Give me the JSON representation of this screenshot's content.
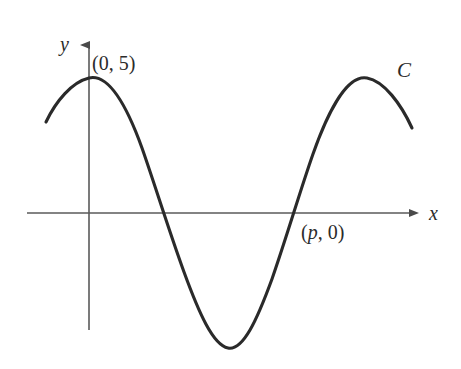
{
  "figure": {
    "background_color": "#ffffff",
    "axis_color": "#5a5a5a",
    "curve_color": "#2a2a2a",
    "text_color": "#2b2b2b"
  },
  "axes": {
    "x_label": "x",
    "y_label": "y",
    "x_axis_start_px": 27,
    "x_axis_end_px": 418,
    "y_axis_top_px": 36,
    "y_axis_bottom_px": 330,
    "origin_px": {
      "x": 89,
      "y": 213
    },
    "arrows": {
      "x": "right-arrowhead",
      "y": "up-arrowhead"
    },
    "grid": false,
    "ticks": []
  },
  "annotations": {
    "y_intercept": {
      "text": "(0, 5)",
      "var": "",
      "px": {
        "x": 92,
        "y": 53
      }
    },
    "x_intercept": {
      "text": "(p, 0)",
      "open": "(",
      "var": "p",
      "rest": ", 0)",
      "px": {
        "x": 301,
        "y": 222
      }
    },
    "curve_label": {
      "text": "C",
      "px": {
        "x": 397,
        "y": 60
      }
    }
  },
  "chart_data": {
    "type": "line",
    "title": "",
    "xlabel": "x",
    "ylabel": "y",
    "legend": [],
    "grid": false,
    "series": [
      {
        "name": "C",
        "description": "Cosine curve with amplitude 5, maximum value 5 at x = 0",
        "amplitude": 5,
        "y_intercept": 5,
        "labeled_points": [
          {
            "label": "(0, 5)",
            "x": 0,
            "y": 5
          },
          {
            "label": "(p, 0)",
            "x": "p",
            "y": 0
          }
        ],
        "key_features_px": {
          "left_end": {
            "x": 46,
            "y": 122
          },
          "first_maximum": {
            "x": 89,
            "y": 78
          },
          "first_zero": {
            "x": 158,
            "y": 213
          },
          "minimum": {
            "x": 228,
            "y": 348
          },
          "second_zero_p": {
            "x": 297,
            "y": 213
          },
          "second_maximum": {
            "x": 367,
            "y": 78
          },
          "right_end": {
            "x": 412,
            "y": 128
          }
        },
        "path": "M 46 122 C 56 101 72 82 89 78 C 110 73 129 112 142 148 C 155 185 168 228 184 272 C 199 313 213 345 228 348 C 243 351 257 320 272 279 C 287 236 300 191 313 154 C 326 117 346 74 367 78 C 384 81 401 104 412 128"
      }
    ],
    "xlim_px": [
      27,
      418
    ],
    "ylim_px": [
      36,
      369
    ]
  }
}
